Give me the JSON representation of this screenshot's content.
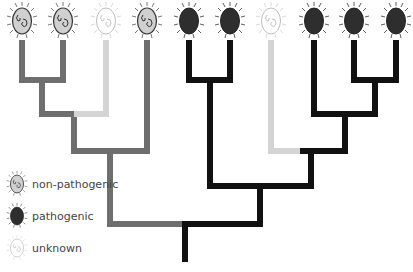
{
  "diagram": {
    "type": "phylogenetic-tree",
    "colors": {
      "non_pathogenic": "#6e6e6e",
      "pathogenic": "#111111",
      "unknown": "#d4d4d4"
    },
    "leaves": [
      {
        "x": 22,
        "status": "non-pathogenic"
      },
      {
        "x": 63,
        "status": "non-pathogenic"
      },
      {
        "x": 106,
        "status": "unknown"
      },
      {
        "x": 147,
        "status": "non-pathogenic"
      },
      {
        "x": 189,
        "status": "pathogenic"
      },
      {
        "x": 230,
        "status": "pathogenic"
      },
      {
        "x": 271,
        "status": "unknown"
      },
      {
        "x": 314,
        "status": "pathogenic"
      },
      {
        "x": 354,
        "status": "pathogenic"
      },
      {
        "x": 396,
        "status": "pathogenic"
      }
    ]
  },
  "legend": {
    "items": [
      {
        "label": "non-pathogenic",
        "icon": "bacterium-non-pathogenic-icon"
      },
      {
        "label": "pathogenic",
        "icon": "bacterium-pathogenic-icon"
      },
      {
        "label": "unknown",
        "icon": "bacterium-unknown-icon"
      }
    ]
  }
}
